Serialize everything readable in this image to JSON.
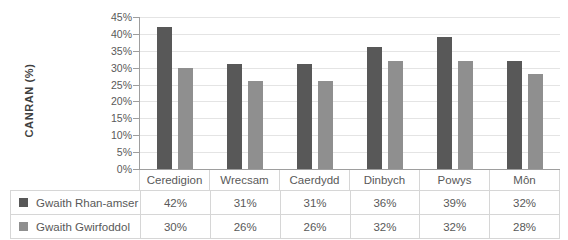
{
  "chart_data": {
    "type": "bar",
    "title": "",
    "ylabel": "CANRAN (%)",
    "xlabel": "",
    "categories": [
      "Ceredigion",
      "Wrecsam",
      "Caerdydd",
      "Dinbych",
      "Powys",
      "Môn"
    ],
    "series": [
      {
        "name": "Gwaith Rhan-amser",
        "values": [
          42,
          31,
          31,
          36,
          39,
          32
        ],
        "color": "#585858"
      },
      {
        "name": "Gwaith Gwirfoddol",
        "values": [
          30,
          26,
          26,
          32,
          32,
          28
        ],
        "color": "#8f8f8f"
      }
    ],
    "ylim": [
      0,
      45
    ],
    "ytick_step": 5,
    "tick_suffix": "%",
    "value_suffix": "%",
    "grid": true,
    "legend_position": "table-below-with-values",
    "colors": {
      "axis": "#9e9e9e",
      "gridline": "#e4e4e4",
      "table_border": "#d6d6d6",
      "text": "#595959"
    }
  }
}
